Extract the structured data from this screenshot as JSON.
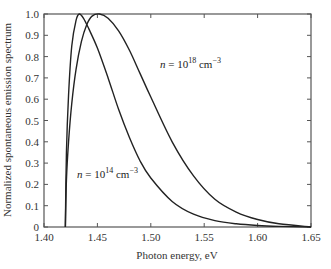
{
  "chart_data": {
    "type": "line",
    "title": "",
    "xlabel": "Photon energy, eV",
    "ylabel": "Normalized spontaneous emission spectrum",
    "xlim": [
      1.4,
      1.65
    ],
    "ylim": [
      0,
      1.0
    ],
    "grid": false,
    "legend": "none (inline annotations)",
    "x_ticks": [
      "1.40",
      "1.45",
      "1.50",
      "1.55",
      "1.60",
      "1.65"
    ],
    "y_ticks": [
      "0",
      "0.1",
      "0.2",
      "0.3",
      "0.4",
      "0.5",
      "0.6",
      "0.7",
      "0.8",
      "0.9",
      "1.0"
    ],
    "series": [
      {
        "name": "n = 10^14 cm^-3",
        "annotation": {
          "base": "n = 10",
          "exp": "14",
          "unit": " cm",
          "unit_exp": "−3"
        },
        "x": [
          1.42,
          1.421,
          1.423,
          1.426,
          1.43,
          1.433,
          1.437,
          1.442,
          1.45,
          1.46,
          1.47,
          1.48,
          1.49,
          1.5,
          1.52,
          1.54,
          1.56,
          1.58,
          1.6,
          1.62,
          1.65
        ],
        "y": [
          0.0,
          0.35,
          0.62,
          0.85,
          0.97,
          1.0,
          0.98,
          0.93,
          0.84,
          0.7,
          0.55,
          0.42,
          0.31,
          0.23,
          0.12,
          0.06,
          0.03,
          0.015,
          0.007,
          0.003,
          0.0
        ]
      },
      {
        "name": "n = 10^18 cm^-3",
        "annotation": {
          "base": "n = 10",
          "exp": "18",
          "unit": " cm",
          "unit_exp": "−3"
        },
        "x": [
          1.42,
          1.421,
          1.423,
          1.426,
          1.43,
          1.435,
          1.44,
          1.445,
          1.452,
          1.46,
          1.47,
          1.48,
          1.49,
          1.5,
          1.52,
          1.54,
          1.56,
          1.58,
          1.6,
          1.62,
          1.65
        ],
        "y": [
          0.0,
          0.22,
          0.4,
          0.58,
          0.74,
          0.87,
          0.95,
          0.99,
          1.0,
          0.98,
          0.92,
          0.83,
          0.72,
          0.61,
          0.4,
          0.24,
          0.13,
          0.07,
          0.035,
          0.015,
          0.0
        ]
      }
    ]
  }
}
